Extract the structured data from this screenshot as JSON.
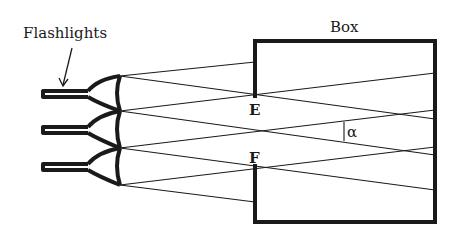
{
  "labels": {
    "flashlights": "Flashlights",
    "box": "Box",
    "point_e": "E",
    "point_f": "F",
    "angle": "α"
  },
  "colors": {
    "ink": "#1a1a1a",
    "background": "#ffffff"
  },
  "figure": {
    "flashlight_count": 3,
    "box": {
      "x": 255,
      "y": 41,
      "width": 180,
      "height": 181
    },
    "lens_x": 120,
    "lens_joints_y": [
      76,
      111,
      148,
      185
    ],
    "aperture": {
      "top_y": 95,
      "bottom_y": 167
    }
  }
}
